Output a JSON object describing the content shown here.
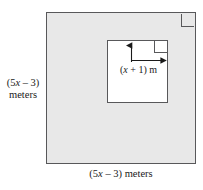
{
  "figure": {
    "type": "geometry-diagram",
    "colors": {
      "outer_fill": "#e8e8e8",
      "inner_fill": "#ffffff",
      "stroke": "#58585a",
      "text": "#1a1a1a",
      "page_background": "#ffffff"
    },
    "outer_square": {
      "name": "outer-square",
      "side_label_left": "(5x – 3)",
      "side_label_left_units": "meters",
      "side_label_bottom": "(5x – 3) meters",
      "right_angle_marker": "top-right"
    },
    "inner_square": {
      "name": "inner-square",
      "side_label": "(x + 1) m",
      "right_angle_marker": "top-right",
      "arrows": [
        {
          "name": "up-arrow",
          "direction": "up"
        },
        {
          "name": "right-arrow",
          "direction": "right"
        }
      ]
    },
    "labels": {
      "left_line1_prefix": "(5",
      "left_line1_var": "x",
      "left_line1_suffix": " – 3)",
      "left_line2": "meters",
      "bottom_prefix": "(5",
      "bottom_var": "x",
      "bottom_suffix": " – 3) meters",
      "inner_prefix": "(",
      "inner_var": "x",
      "inner_suffix": " + 1) m"
    }
  }
}
